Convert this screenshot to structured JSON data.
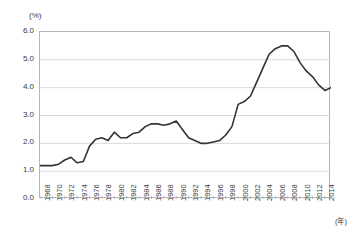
{
  "chart_data": {
    "type": "line",
    "title": "",
    "xlabel": "(年)",
    "ylabel": "(%)",
    "ylim": [
      0.0,
      6.0
    ],
    "ytick_step": 1.0,
    "xlim": [
      1968,
      2015
    ],
    "grid": true,
    "legend": "none",
    "line_color": "#333333",
    "grid_color": "#d9d9d9",
    "axis_color": "#b6b6b6",
    "ytick_labels": [
      "6.0",
      "5.0",
      "4.0",
      "3.0",
      "2.0",
      "1.0",
      "0.0"
    ],
    "ytick_values": [
      6.0,
      5.0,
      4.0,
      3.0,
      2.0,
      1.0,
      0.0
    ],
    "xtick_labels": [
      "1968",
      "1970",
      "1972",
      "1974",
      "1976",
      "1978",
      "1980",
      "1982",
      "1984",
      "1986",
      "1988",
      "1990",
      "1992",
      "1994",
      "1996",
      "1998",
      "2000",
      "2002",
      "2004",
      "2006",
      "2008",
      "2010",
      "2012",
      "2014"
    ],
    "xtick_values": [
      1968,
      1970,
      1972,
      1974,
      1976,
      1978,
      1980,
      1982,
      1984,
      1986,
      1988,
      1990,
      1992,
      1994,
      1996,
      1998,
      2000,
      2002,
      2004,
      2006,
      2008,
      2010,
      2012,
      2014
    ],
    "x": [
      1968,
      1969,
      1970,
      1971,
      1972,
      1973,
      1974,
      1975,
      1976,
      1977,
      1978,
      1979,
      1980,
      1981,
      1982,
      1983,
      1984,
      1985,
      1986,
      1987,
      1988,
      1989,
      1990,
      1991,
      1992,
      1993,
      1994,
      1995,
      1996,
      1997,
      1998,
      1999,
      2000,
      2001,
      2002,
      2003,
      2004,
      2005,
      2006,
      2007,
      2008,
      2009,
      2010,
      2011,
      2012,
      2013,
      2014,
      2015
    ],
    "values": [
      1.2,
      1.2,
      1.2,
      1.25,
      1.4,
      1.5,
      1.3,
      1.35,
      1.9,
      2.15,
      2.2,
      2.1,
      2.4,
      2.2,
      2.2,
      2.35,
      2.4,
      2.6,
      2.7,
      2.7,
      2.65,
      2.7,
      2.8,
      2.5,
      2.2,
      2.1,
      2.0,
      2.0,
      2.05,
      2.1,
      2.3,
      2.6,
      3.4,
      3.5,
      3.7,
      4.2,
      4.7,
      5.2,
      5.4,
      5.5,
      5.5,
      5.3,
      4.9,
      4.6,
      4.4,
      4.1,
      3.9,
      4.0
    ]
  },
  "series_detail": {
    "name": "rate",
    "point_count": 48,
    "note": "annual values, percent"
  }
}
